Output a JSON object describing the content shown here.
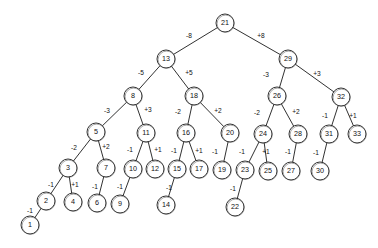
{
  "diagram": {
    "type": "tree",
    "colors": {
      "background": "#ffffff",
      "stroke": "#1a1a1a",
      "node_fill": "#ffffff",
      "text": "#111111"
    },
    "node_radius": 9,
    "nodes": [
      {
        "id": "n21",
        "label": "21",
        "x": 225,
        "y": 23
      },
      {
        "id": "n13",
        "label": "13",
        "x": 166,
        "y": 59
      },
      {
        "id": "n29",
        "label": "29",
        "x": 288,
        "y": 59
      },
      {
        "id": "n8",
        "label": "8",
        "x": 133,
        "y": 96
      },
      {
        "id": "n18",
        "label": "18",
        "x": 194,
        "y": 96
      },
      {
        "id": "n26",
        "label": "26",
        "x": 277,
        "y": 96
      },
      {
        "id": "n32",
        "label": "32",
        "x": 341,
        "y": 97
      },
      {
        "id": "n5",
        "label": "5",
        "x": 96,
        "y": 132
      },
      {
        "id": "n11",
        "label": "11",
        "x": 146,
        "y": 133
      },
      {
        "id": "n16",
        "label": "16",
        "x": 186,
        "y": 133
      },
      {
        "id": "n20",
        "label": "20",
        "x": 230,
        "y": 133
      },
      {
        "id": "n24",
        "label": "24",
        "x": 263,
        "y": 134
      },
      {
        "id": "n28",
        "label": "28",
        "x": 298,
        "y": 134
      },
      {
        "id": "n31",
        "label": "31",
        "x": 329,
        "y": 134
      },
      {
        "id": "n33",
        "label": "33",
        "x": 357,
        "y": 134
      },
      {
        "id": "n3",
        "label": "3",
        "x": 68,
        "y": 168
      },
      {
        "id": "n7",
        "label": "7",
        "x": 106,
        "y": 168
      },
      {
        "id": "n10",
        "label": "10",
        "x": 133,
        "y": 169
      },
      {
        "id": "n12",
        "label": "12",
        "x": 155,
        "y": 169
      },
      {
        "id": "n15",
        "label": "15",
        "x": 177,
        "y": 169
      },
      {
        "id": "n17",
        "label": "17",
        "x": 199,
        "y": 169
      },
      {
        "id": "n19",
        "label": "19",
        "x": 222,
        "y": 170
      },
      {
        "id": "n23",
        "label": "23",
        "x": 245,
        "y": 170
      },
      {
        "id": "n25",
        "label": "25",
        "x": 268,
        "y": 171
      },
      {
        "id": "n27",
        "label": "27",
        "x": 291,
        "y": 171
      },
      {
        "id": "n30",
        "label": "30",
        "x": 320,
        "y": 171
      },
      {
        "id": "n2",
        "label": "2",
        "x": 46,
        "y": 201
      },
      {
        "id": "n4",
        "label": "4",
        "x": 73,
        "y": 202
      },
      {
        "id": "n6",
        "label": "6",
        "x": 97,
        "y": 203
      },
      {
        "id": "n9",
        "label": "9",
        "x": 120,
        "y": 204
      },
      {
        "id": "n14",
        "label": "14",
        "x": 166,
        "y": 205
      },
      {
        "id": "n22",
        "label": "22",
        "x": 235,
        "y": 207
      },
      {
        "id": "n1",
        "label": "1",
        "x": 30,
        "y": 225
      }
    ],
    "edges": [
      {
        "from": "n21",
        "to": "n13",
        "label": "-8",
        "lx": 189,
        "ly": 36
      },
      {
        "from": "n21",
        "to": "n29",
        "label": "+8",
        "lx": 261,
        "ly": 36
      },
      {
        "from": "n13",
        "to": "n8",
        "label": "-5",
        "lx": 141,
        "ly": 73
      },
      {
        "from": "n13",
        "to": "n18",
        "label": "+5",
        "lx": 189,
        "ly": 73
      },
      {
        "from": "n29",
        "to": "n26",
        "label": "-3",
        "lx": 266,
        "ly": 75
      },
      {
        "from": "n29",
        "to": "n32",
        "label": "+3",
        "lx": 317,
        "ly": 74
      },
      {
        "from": "n8",
        "to": "n5",
        "label": "-3",
        "lx": 107,
        "ly": 111
      },
      {
        "from": "n8",
        "to": "n11",
        "label": "+3",
        "lx": 148,
        "ly": 110
      },
      {
        "from": "n18",
        "to": "n16",
        "label": "-2",
        "lx": 178,
        "ly": 112
      },
      {
        "from": "n18",
        "to": "n20",
        "label": "+2",
        "lx": 218,
        "ly": 111
      },
      {
        "from": "n26",
        "to": "n24",
        "label": "-2",
        "lx": 257,
        "ly": 113
      },
      {
        "from": "n26",
        "to": "n28",
        "label": "+2",
        "lx": 296,
        "ly": 112
      },
      {
        "from": "n32",
        "to": "n31",
        "label": "-1",
        "lx": 325,
        "ly": 116
      },
      {
        "from": "n32",
        "to": "n33",
        "label": "+1",
        "lx": 353,
        "ly": 116
      },
      {
        "from": "n5",
        "to": "n3",
        "label": "-2",
        "lx": 74,
        "ly": 148
      },
      {
        "from": "n5",
        "to": "n7",
        "label": "+2",
        "lx": 106,
        "ly": 147
      },
      {
        "from": "n11",
        "to": "n10",
        "label": "-1",
        "lx": 130,
        "ly": 150
      },
      {
        "from": "n11",
        "to": "n12",
        "label": "+1",
        "lx": 158,
        "ly": 150
      },
      {
        "from": "n16",
        "to": "n15",
        "label": "-1",
        "lx": 174,
        "ly": 151
      },
      {
        "from": "n16",
        "to": "n17",
        "label": "+1",
        "lx": 199,
        "ly": 151
      },
      {
        "from": "n20",
        "to": "n19",
        "label": "-1",
        "lx": 215,
        "ly": 152
      },
      {
        "from": "n24",
        "to": "n23",
        "label": "-1",
        "lx": 242,
        "ly": 152
      },
      {
        "from": "n24",
        "to": "n25",
        "label": "+1",
        "lx": 266,
        "ly": 152
      },
      {
        "from": "n28",
        "to": "n27",
        "label": "-1",
        "lx": 288,
        "ly": 152
      },
      {
        "from": "n31",
        "to": "n30",
        "label": "-1",
        "lx": 316,
        "ly": 153
      },
      {
        "from": "n3",
        "to": "n2",
        "label": "-1",
        "lx": 51,
        "ly": 185
      },
      {
        "from": "n3",
        "to": "n4",
        "label": "+1",
        "lx": 75,
        "ly": 185
      },
      {
        "from": "n7",
        "to": "n6",
        "label": "-1",
        "lx": 95,
        "ly": 187
      },
      {
        "from": "n10",
        "to": "n9",
        "label": "-1",
        "lx": 120,
        "ly": 187
      },
      {
        "from": "n15",
        "to": "n14",
        "label": "-1",
        "lx": 169,
        "ly": 188
      },
      {
        "from": "n23",
        "to": "n22",
        "label": "-1",
        "lx": 233,
        "ly": 189
      },
      {
        "from": "n2",
        "to": "n1",
        "label": "-1",
        "lx": 30,
        "ly": 211
      }
    ]
  }
}
